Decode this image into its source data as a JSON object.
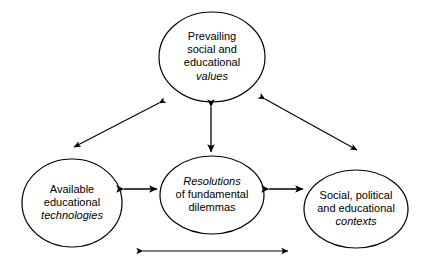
{
  "diagram": {
    "background_color": "#ffffff",
    "stroke_color": "#000000",
    "text_color": "#000000",
    "nodes": [
      {
        "id": "values",
        "name": "prevailing-social-and-educational-values",
        "lines": [
          "Prevailing",
          "social and",
          "educational",
          "values"
        ],
        "italic_lines": [
          "values"
        ],
        "line1": "Prevailing",
        "line2": "social and",
        "line3": "educational",
        "line4": "values",
        "shape": "ellipse",
        "cx": 212,
        "cy": 57,
        "rx": 53,
        "ry": 45
      },
      {
        "id": "resolutions",
        "name": "resolutions-of-fundamental-dilemmas",
        "lines": [
          "Resolutions",
          "of fundamental",
          "dilemmas"
        ],
        "italic_lines": [
          "Resolutions"
        ],
        "line1": "Resolutions",
        "line2": "of fundamental",
        "line3": "dilemmas",
        "shape": "ellipse",
        "cx": 212,
        "cy": 195,
        "rx": 52,
        "ry": 39
      },
      {
        "id": "technologies",
        "name": "available-educational-technologies",
        "lines": [
          "Available",
          "educational",
          "technologies"
        ],
        "italic_lines": [
          "technologies"
        ],
        "line1": "Available",
        "line2": "educational",
        "line3": "technologies",
        "shape": "ellipse",
        "cx": 72,
        "cy": 203,
        "rx": 50,
        "ry": 44
      },
      {
        "id": "contexts",
        "name": "social-political-and-educational-contexts",
        "lines": [
          "Social, political",
          "and educational",
          "contexts"
        ],
        "italic_lines": [
          "contexts"
        ],
        "line1": "Social, political",
        "line2": "and educational",
        "line3": "contexts",
        "shape": "ellipse",
        "cx": 356,
        "cy": 209,
        "rx": 52,
        "ry": 39
      }
    ],
    "connectors": [
      {
        "id": "values-technologies",
        "name": "arrow-values-technologies",
        "from": "values",
        "to": "technologies",
        "style": "double-headed",
        "x1": 159,
        "y1": 103,
        "x2": 74,
        "y2": 147
      },
      {
        "id": "values-contexts",
        "name": "arrow-values-contexts",
        "from": "values",
        "to": "contexts",
        "style": "double-headed",
        "x1": 265,
        "y1": 99,
        "x2": 357,
        "y2": 150
      },
      {
        "id": "values-resolutions",
        "name": "arrow-values-resolutions",
        "from": "values",
        "to": "resolutions",
        "style": "double-headed",
        "x1": 211,
        "y1": 107,
        "x2": 211,
        "y2": 152
      },
      {
        "id": "technologies-resolutions",
        "name": "arrow-technologies-resolutions",
        "from": "technologies",
        "to": "resolutions",
        "style": "double-headed",
        "x1": 124,
        "y1": 189,
        "x2": 157,
        "y2": 189
      },
      {
        "id": "resolutions-contexts",
        "name": "arrow-resolutions-contexts",
        "from": "resolutions",
        "to": "contexts",
        "style": "double-headed",
        "x1": 269,
        "y1": 189,
        "x2": 303,
        "y2": 189
      },
      {
        "id": "technologies-contexts",
        "name": "arrow-technologies-contexts",
        "from": "technologies",
        "to": "contexts",
        "style": "double-headed",
        "x1": 143,
        "y1": 251,
        "x2": 288,
        "y2": 251
      }
    ]
  }
}
